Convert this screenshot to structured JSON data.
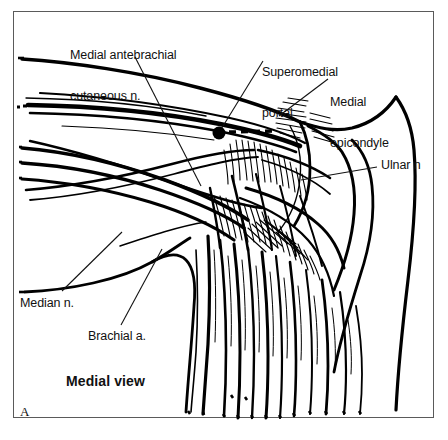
{
  "figure": {
    "panel_letter": "A",
    "view_caption": "Medial view",
    "frame_color": "#5a5a5a",
    "ink_color": "#000000",
    "background_color": "#ffffff",
    "labels": [
      {
        "id": "medial-antebrachial-cutaneous-nerve",
        "text": "Medial antebrachial\ncutaneous n.",
        "line1": "Medial antebrachial",
        "line2": "cutaneous n.",
        "x": 70,
        "y": 22
      },
      {
        "id": "superomedial-portal",
        "text": "Superomedial\nportal",
        "line1": "Superomedial",
        "line2": "portal",
        "x": 262,
        "y": 39
      },
      {
        "id": "medial-epicondyle",
        "text": "Medial\nepicondyle",
        "line1": "Medial",
        "line2": "epicondyle",
        "x": 330,
        "y": 69
      },
      {
        "id": "ulnar-nerve",
        "text": "Ulnar n",
        "x": 381,
        "y": 159
      },
      {
        "id": "median-nerve",
        "text": "Median n.",
        "x": 20,
        "y": 297
      },
      {
        "id": "brachial-artery",
        "text": "Brachial a.",
        "x": 88,
        "y": 330
      }
    ],
    "portal_marker": {
      "id": "superomedial-portal-dot",
      "cx": 219,
      "cy": 133,
      "r": 6.5,
      "dashed_trajectory": {
        "x1": 228,
        "y1": 132,
        "x2": 273,
        "y2": 131
      }
    }
  }
}
